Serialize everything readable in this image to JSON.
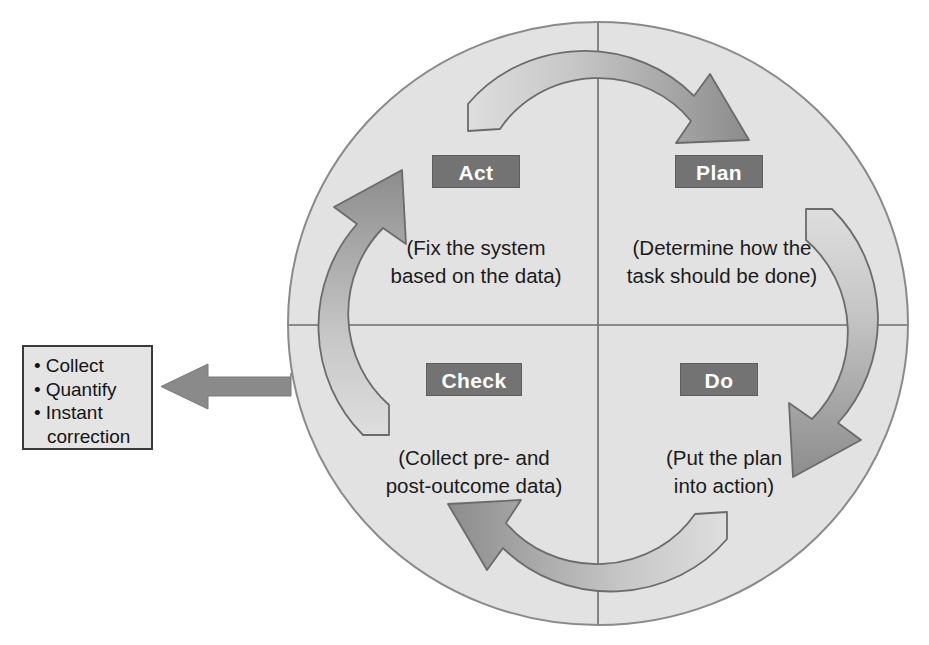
{
  "diagram": {
    "type": "pdca-cycle",
    "title_visible": false,
    "circle": {
      "fill_color": "#e2e2e2",
      "stroke_color": "#8a8a8a",
      "divider_color": "#6e6e6e"
    },
    "arrow": {
      "head_color": "#8a8a8a",
      "tail_color": "#dcdcdc",
      "outline_color": "#6b6b6b"
    },
    "chip": {
      "background": "#737373",
      "text_color": "#ffffff"
    },
    "quadrants": [
      {
        "id": "act",
        "label": "Act",
        "description": "(Fix the system\nbased on the data)",
        "position": "top-left"
      },
      {
        "id": "plan",
        "label": "Plan",
        "description": "(Determine how the\ntask should be done)",
        "position": "top-right"
      },
      {
        "id": "check",
        "label": "Check",
        "description": "(Collect pre- and\npost-outcome data)",
        "position": "bottom-left"
      },
      {
        "id": "do",
        "label": "Do",
        "description": "(Put the plan\ninto action)",
        "position": "bottom-right"
      }
    ],
    "rotation_order": [
      "Plan",
      "Do",
      "Check",
      "Act"
    ],
    "rotation_direction": "clockwise"
  },
  "callout": {
    "source_quadrant": "check",
    "border_color": "#3a3a3a",
    "fill_color": "#e4e4e4",
    "arrow_color": "#8a8a8a",
    "items": [
      "Collect",
      "Quantify",
      "Instant\ncorrection"
    ]
  }
}
